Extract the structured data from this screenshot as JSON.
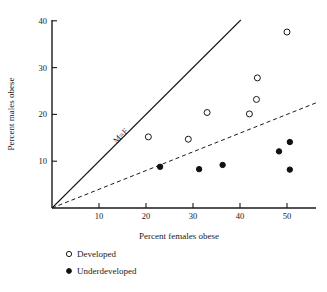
{
  "chart_data": {
    "type": "scatter",
    "title": "",
    "xlabel": "Percent females obese",
    "ylabel": "Percent males obese",
    "xlim": [
      0,
      57
    ],
    "ylim": [
      0,
      41
    ],
    "xticks": [
      10,
      20,
      30,
      40,
      50
    ],
    "yticks": [
      10,
      20,
      30,
      40
    ],
    "xtick_labels": [
      "10",
      "20",
      "30",
      "40",
      "50"
    ],
    "ytick_labels": [
      "10",
      "20",
      "30",
      "40"
    ],
    "grid": false,
    "legend_position": "below-left",
    "annotations": [
      {
        "text": "M=F",
        "x": 15,
        "y": 15,
        "rotation": -45,
        "note": "label on line of equality"
      }
    ],
    "reference_lines": [
      {
        "name": "equality-line",
        "style": "solid",
        "slope": 1,
        "intercept": 0,
        "label": "M=F"
      },
      {
        "name": "trend-line",
        "style": "dashed",
        "slope": 0.4,
        "intercept": 0,
        "label": ""
      }
    ],
    "series": [
      {
        "name": "Developed",
        "marker": "open-circle",
        "color": "#1a1a1a",
        "points": [
          {
            "x": 20.5,
            "y": 15.2
          },
          {
            "x": 29.0,
            "y": 14.7
          },
          {
            "x": 33.0,
            "y": 20.4
          },
          {
            "x": 42.0,
            "y": 20.1
          },
          {
            "x": 43.5,
            "y": 23.2
          },
          {
            "x": 43.7,
            "y": 27.8
          },
          {
            "x": 50.0,
            "y": 37.6
          }
        ]
      },
      {
        "name": "Underdeveloped",
        "marker": "filled-circle",
        "color": "#111111",
        "points": [
          {
            "x": 23.0,
            "y": 8.8
          },
          {
            "x": 31.3,
            "y": 8.3
          },
          {
            "x": 36.3,
            "y": 9.2
          },
          {
            "x": 48.3,
            "y": 12.1
          },
          {
            "x": 50.6,
            "y": 14.1
          },
          {
            "x": 50.6,
            "y": 8.2
          }
        ]
      }
    ]
  },
  "legend": {
    "items": [
      {
        "label": "Developed",
        "marker": "open-circle"
      },
      {
        "label": "Underdeveloped",
        "marker": "filled-circle"
      }
    ]
  }
}
